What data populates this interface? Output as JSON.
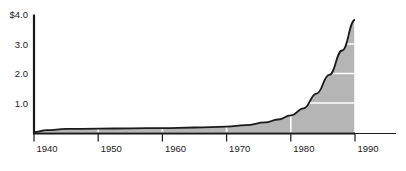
{
  "chart_data": {
    "type": "area",
    "title": "",
    "subtitle": "",
    "xlabel": "",
    "ylabel": "",
    "xlim": [
      1940,
      1990
    ],
    "ylim": [
      0,
      4.0
    ],
    "grid": true,
    "legend": null,
    "x_tick_labels": [
      "1940",
      "1950",
      "1960",
      "1970",
      "1980",
      "1990"
    ],
    "x_ticks": [
      1940,
      1950,
      1960,
      1970,
      1980,
      1990
    ],
    "y_tick_labels": [
      "$4.0",
      "3.0",
      "2.0",
      "1.0"
    ],
    "y_ticks": [
      4.0,
      3.0,
      2.0,
      1.0
    ],
    "x": [
      1940,
      1942,
      1945,
      1950,
      1955,
      1960,
      1965,
      1970,
      1973,
      1976,
      1978,
      1980,
      1982,
      1984,
      1986,
      1988,
      1990
    ],
    "values": [
      0.02,
      0.08,
      0.12,
      0.13,
      0.14,
      0.15,
      0.17,
      0.2,
      0.25,
      0.34,
      0.44,
      0.58,
      0.82,
      1.32,
      1.95,
      2.78,
      3.82
    ],
    "series": [
      {
        "name": "value",
        "values": [
          0.02,
          0.08,
          0.12,
          0.13,
          0.14,
          0.15,
          0.17,
          0.2,
          0.25,
          0.34,
          0.44,
          0.58,
          0.82,
          1.32,
          1.95,
          2.78,
          3.82
        ]
      }
    ],
    "colors": {
      "fill": "#b5b5b5",
      "line": "#1a1a1a",
      "axis": "#1a1a1a",
      "gridline": "#ffffff",
      "background": "#ffffff",
      "text": "#1a1a1a"
    }
  }
}
